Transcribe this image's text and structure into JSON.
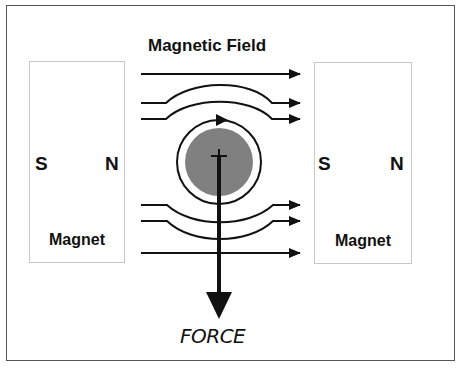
{
  "diagram": {
    "title": "Magnetic Field",
    "force_label": "FORCE",
    "left_magnet": {
      "south": "S",
      "north": "N",
      "label": "Magnet"
    },
    "right_magnet": {
      "south": "S",
      "north": "N",
      "label": "Magnet"
    },
    "colors": {
      "line": "#111111",
      "conductor": "#808080",
      "border": "#555555",
      "magnet_border": "#c8c8c8"
    }
  }
}
